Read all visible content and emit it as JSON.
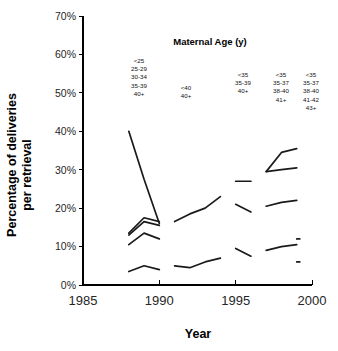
{
  "chart_data": {
    "type": "line",
    "title": "",
    "xlabel": "Year",
    "ylabel": "Percentage of deliveries per retrieval",
    "ylabel_line1": "Percentage of deliveries",
    "ylabel_line2": "per retrieval",
    "xlim": [
      1985,
      2000
    ],
    "ylim": [
      0,
      70
    ],
    "xticks": [
      1985,
      1990,
      1995,
      2000
    ],
    "xtick_labels": [
      "1985",
      "1990",
      "1995",
      "2000"
    ],
    "yticks": [
      0,
      10,
      20,
      30,
      40,
      50,
      60,
      70
    ],
    "ytick_labels": [
      "0%",
      "10%",
      "20%",
      "30%",
      "40%",
      "50%",
      "60%",
      "70%"
    ],
    "grid": false,
    "legend_position": "inside-top",
    "legend_title": "Maternal Age (y)",
    "legend_groups": [
      {
        "period": "1988-1990",
        "labels": [
          "<25",
          "25-29",
          "30-34",
          "35-39",
          "40+"
        ]
      },
      {
        "period": "1991-1994",
        "labels": [
          "<40",
          "40+"
        ]
      },
      {
        "period": "1995-1996",
        "labels": [
          "<35",
          "35-39",
          "40+"
        ]
      },
      {
        "period": "1997-1998",
        "labels": [
          "<35",
          "35-37",
          "38-40",
          "41+"
        ]
      },
      {
        "period": "1999",
        "labels": [
          "<35",
          "35-37",
          "38-40",
          "41-42",
          "43+"
        ]
      }
    ],
    "series": [
      {
        "name": "<25 (1988-1990)",
        "x": [
          1988,
          1989,
          1990
        ],
        "values": [
          40.0,
          27.5,
          16.0
        ]
      },
      {
        "name": "25-29 (1988-1990)",
        "x": [
          1988,
          1989,
          1990
        ],
        "values": [
          13.5,
          17.5,
          16.5
        ]
      },
      {
        "name": "30-34 (1988-1990)",
        "x": [
          1988,
          1989,
          1990
        ],
        "values": [
          13.0,
          16.5,
          15.5
        ]
      },
      {
        "name": "35-39 (1988-1990)",
        "x": [
          1988,
          1989,
          1990
        ],
        "values": [
          10.5,
          13.5,
          12.0
        ]
      },
      {
        "name": "40+ (1988-1990)",
        "x": [
          1988,
          1989,
          1990
        ],
        "values": [
          3.5,
          5.0,
          4.0
        ]
      },
      {
        "name": "<40 (1991-1994)",
        "x": [
          1991,
          1992,
          1993,
          1994
        ],
        "values": [
          16.5,
          18.5,
          20.0,
          23.0
        ]
      },
      {
        "name": "40+ (1991-1994)",
        "x": [
          1991,
          1992,
          1993,
          1994
        ],
        "values": [
          5.0,
          4.5,
          6.0,
          7.0
        ]
      },
      {
        "name": "<35 (1995-1996)",
        "x": [
          1995,
          1996
        ],
        "values": [
          27.0,
          27.0
        ]
      },
      {
        "name": "35-39 (1995-1996)",
        "x": [
          1995,
          1996
        ],
        "values": [
          21.0,
          19.0
        ]
      },
      {
        "name": "40+ (1995-1996)",
        "x": [
          1995,
          1996
        ],
        "values": [
          9.5,
          7.5
        ]
      },
      {
        "name": "<35 (1997-1999)",
        "x": [
          1997,
          1998,
          1999
        ],
        "values": [
          29.5,
          34.5,
          35.5
        ]
      },
      {
        "name": "35-37 (1997-1999)",
        "x": [
          1997,
          1998,
          1999
        ],
        "values": [
          29.5,
          30.0,
          30.5
        ]
      },
      {
        "name": "38-40 (1997-1999)",
        "x": [
          1997,
          1998,
          1999
        ],
        "values": [
          20.5,
          21.5,
          22.0
        ]
      },
      {
        "name": "41-42 (1997-1999)",
        "x": [
          1997,
          1998,
          1999
        ],
        "values": [
          9.0,
          10.0,
          10.5
        ]
      },
      {
        "name": "43+ (1999 marker high)",
        "x": [
          1999,
          1999.2
        ],
        "values": [
          12.0,
          12.0
        ]
      },
      {
        "name": "43+ (1999 marker low)",
        "x": [
          1999,
          1999.2
        ],
        "values": [
          6.0,
          6.0
        ]
      }
    ]
  }
}
